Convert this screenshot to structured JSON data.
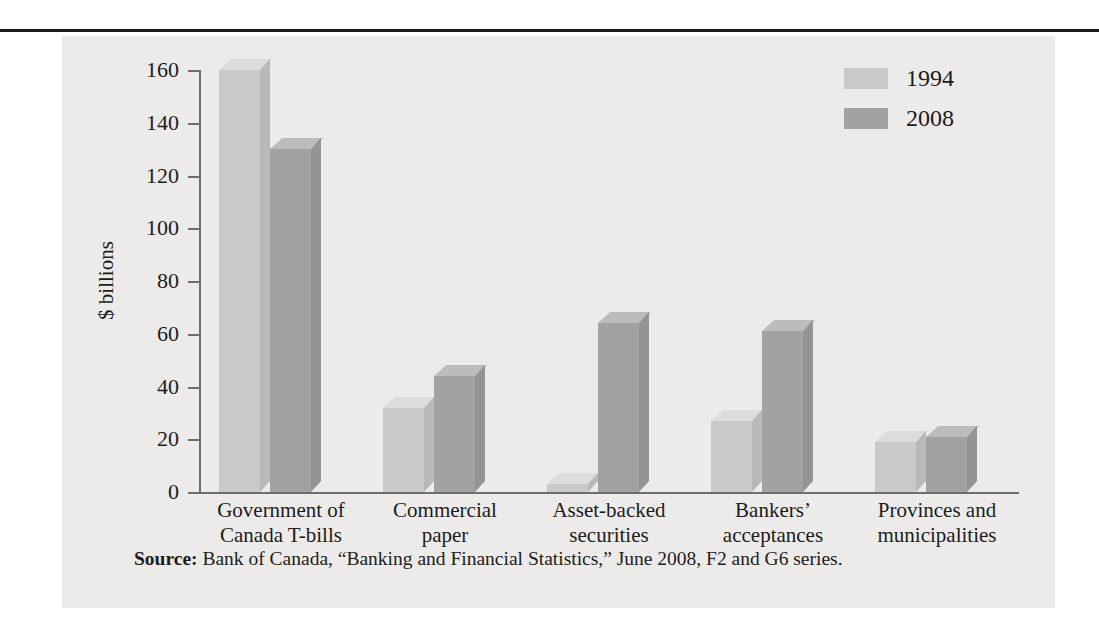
{
  "figure": {
    "y_axis_title": "$ billions",
    "source_label": "Source:",
    "source_text": "Bank of Canada, “Banking and Financial Statistics,” June 2008, F2 and G6 series."
  },
  "legend": {
    "position": "top-right",
    "entries": [
      {
        "label": "1994",
        "color": "#c9c9c9"
      },
      {
        "label": "2008",
        "color": "#a2a2a2"
      }
    ]
  },
  "chart_data": {
    "type": "bar",
    "title": "",
    "subtitle": "",
    "xlabel": "",
    "ylabel": "$ billions",
    "ylim": [
      0,
      160
    ],
    "yticks": [
      0,
      20,
      40,
      60,
      80,
      100,
      120,
      140,
      160
    ],
    "ytick_labels": [
      "0",
      "20",
      "40",
      "60",
      "80",
      "100",
      "120",
      "140",
      "160"
    ],
    "grid": false,
    "legend_position": "top-right",
    "categories": [
      "Government of\nCanada T-bills",
      "Commercial\npaper",
      "Asset-backed\nsecurities",
      "Bankers’\nacceptances",
      "Provinces and\nmunicipalities"
    ],
    "category_lines": [
      [
        "Government of",
        "Canada T-bills"
      ],
      [
        "Commercial",
        "paper"
      ],
      [
        "Asset-backed",
        "securities"
      ],
      [
        "Bankers’",
        "acceptances"
      ],
      [
        "Provinces and",
        "municipalities"
      ]
    ],
    "series": [
      {
        "name": "1994",
        "color": "#c9c9c9",
        "values": [
          160,
          32,
          3,
          27,
          19
        ]
      },
      {
        "name": "2008",
        "color": "#a2a2a2",
        "values": [
          130,
          44,
          64,
          61,
          21
        ]
      }
    ],
    "units": "billions of dollars",
    "source": "Bank of Canada, “Banking and Financial Statistics,” June 2008, F2 and G6 series."
  }
}
